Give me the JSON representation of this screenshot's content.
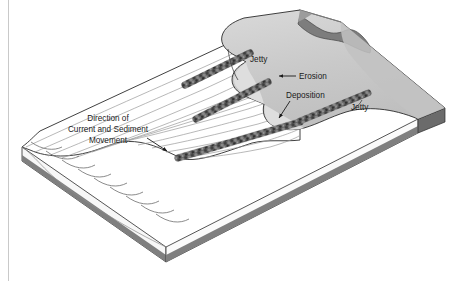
{
  "figure": {
    "kind": "block-diagram",
    "width": 460,
    "height": 281
  },
  "labels": {
    "jetty_upper": "Jetty",
    "jetty_lower": "Jetty",
    "erosion": "Erosion",
    "deposition": "Deposition",
    "current_line1": "Direction of",
    "current_line2": "Current and Sediment",
    "current_line3": "Movement"
  },
  "colors": {
    "background": "#ffffff",
    "water_surface": "#ffffff",
    "land_surface": "#c9c9c9",
    "land_highlight": "#d8d8d8",
    "dark_landform": "#7d7d7d",
    "block_right_face": "#808080",
    "block_front_face": "#f7f7f7",
    "block_bottom_strip": "#7f7f7f",
    "outline": "#2b2b2b",
    "wave_line": "#8a8a8a",
    "riprap_dark": "#4a4a4a",
    "riprap_mid": "#6e6e6e",
    "riprap_light": "#a8a8a8",
    "text": "#1a1a1a",
    "page_rule": "#c9c9c9"
  },
  "annotations": {
    "current_arrow": "arrow pointing down-right across the water surface",
    "erosion_arrow": "horizontal leader with arrowhead pointing left at the eroded shoreline",
    "deposition_arrow": "diagonal leader with arrowhead pointing down-left at the sediment build-up",
    "jetty_upper_leader": "short vertical leader to the upper jetty",
    "jetty_lower_leader": "short leader to the lower jetty"
  },
  "features": {
    "jetty_count": 3,
    "jetty_material": "riprap-rubble",
    "wave_crest_count": 13,
    "scallop_count": 9
  }
}
